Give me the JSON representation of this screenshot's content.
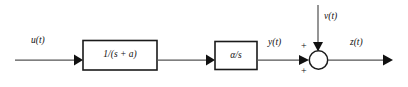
{
  "diagram": {
    "type": "control-system-block-diagram",
    "colors": {
      "background": "#ffffff",
      "block_stroke": "#1a1a1a",
      "wire": "#555555",
      "arrow": "#111111",
      "text": "#111111"
    },
    "signals": {
      "input": "u(t)",
      "intermediate": "y(t)",
      "disturbance": "v(t)",
      "output": "z(t)"
    },
    "blocks": [
      {
        "id": "block-1",
        "label": "1/(s + a)",
        "name": "transfer-function-block-first-order"
      },
      {
        "id": "block-2",
        "label": "α/s",
        "name": "transfer-function-block-integrator"
      }
    ],
    "summing_junction": {
      "name": "summing-junction",
      "signs": [
        "+",
        "+"
      ],
      "top_sign": "+",
      "bottom_sign": "+"
    }
  }
}
